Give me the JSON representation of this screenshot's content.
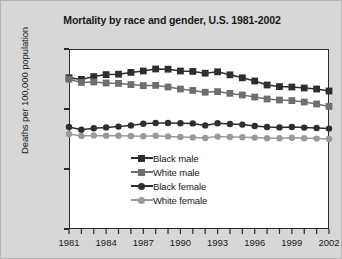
{
  "chart_data": {
    "type": "line",
    "title": "Mortality by race and gender, U.S. 1981-2002",
    "xlabel": "",
    "ylabel": "Deaths per 100,000 population",
    "grid": false,
    "legend_position": "inside-lower-center",
    "xlim": [
      1981,
      2002
    ],
    "ylim": [
      0,
      9000
    ],
    "ytick_labels": [
      "0",
      "3000",
      "6000",
      "9000"
    ],
    "ytick_values": [
      0,
      3000,
      6000,
      9000
    ],
    "xtick_labels": [
      "1981",
      "1984",
      "1987",
      "1990",
      "1993",
      "1996",
      "1999",
      "2002"
    ],
    "xtick_values": [
      1981,
      1984,
      1987,
      1990,
      1993,
      1996,
      1999,
      2002
    ],
    "x": [
      1981,
      1982,
      1983,
      1984,
      1985,
      1986,
      1987,
      1988,
      1989,
      1990,
      1991,
      1992,
      1993,
      1994,
      1995,
      1996,
      1997,
      1998,
      1999,
      2000,
      2001,
      2002
    ],
    "series": [
      {
        "name": "Black male",
        "color": "#2e2e2e",
        "marker": "square",
        "values": [
          7560,
          7480,
          7620,
          7720,
          7740,
          7830,
          7900,
          8000,
          7990,
          7900,
          7880,
          7790,
          7860,
          7710,
          7560,
          7400,
          7200,
          7120,
          7100,
          7050,
          7000,
          6900
        ]
      },
      {
        "name": "White male",
        "color": "#6e6e6e",
        "marker": "square",
        "values": [
          7490,
          7330,
          7350,
          7300,
          7280,
          7220,
          7170,
          7180,
          7100,
          7000,
          6930,
          6840,
          6870,
          6780,
          6700,
          6600,
          6500,
          6450,
          6420,
          6350,
          6250,
          6130
        ]
      },
      {
        "name": "Black female",
        "color": "#2e2e2e",
        "marker": "circle",
        "values": [
          5100,
          4960,
          5040,
          5080,
          5120,
          5180,
          5260,
          5300,
          5300,
          5290,
          5280,
          5180,
          5290,
          5250,
          5220,
          5150,
          5100,
          5080,
          5100,
          5070,
          5050,
          5020
        ]
      },
      {
        "name": "White female",
        "color": "#9a9a9a",
        "marker": "circle",
        "values": [
          4750,
          4650,
          4680,
          4660,
          4660,
          4650,
          4640,
          4660,
          4630,
          4600,
          4580,
          4550,
          4620,
          4600,
          4590,
          4570,
          4540,
          4540,
          4560,
          4540,
          4520,
          4500
        ]
      }
    ]
  },
  "legend": {
    "items": [
      {
        "label": "Black male"
      },
      {
        "label": "White male"
      },
      {
        "label": "Black female"
      },
      {
        "label": "White female"
      }
    ]
  }
}
